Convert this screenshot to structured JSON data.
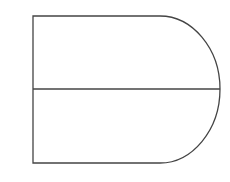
{
  "diagram": {
    "stroke_color": "#444444",
    "background": "#ffffff",
    "shape": {
      "left": 33,
      "top": 16,
      "bottom": 163,
      "straight_right": 160,
      "rightmost": 220,
      "midline_y": 89
    }
  }
}
